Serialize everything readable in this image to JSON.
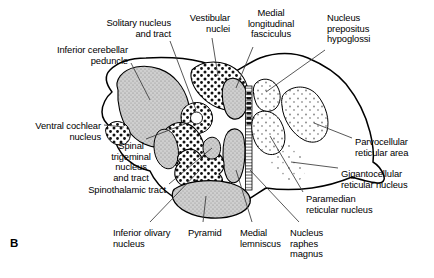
{
  "figure": {
    "panel_letter": "B"
  },
  "labels": [
    {
      "id": "solitary-nucleus-and-tract",
      "lines": [
        "Solitary nucleus",
        "and tract"
      ],
      "align": "right",
      "x": 171,
      "y": 18
    },
    {
      "id": "vestibular-nuclei",
      "lines": [
        "Vestibular",
        "nuclei"
      ],
      "align": "right",
      "x": 230,
      "y": 13
    },
    {
      "id": "medial-longitudinal-fasciculus",
      "lines": [
        "Medial",
        "longitudinal",
        "fasciculus"
      ],
      "align": "center",
      "x": 271,
      "y": 8
    },
    {
      "id": "nucleus-prepositus-hypoglossi",
      "lines": [
        "Nucleus",
        "prepositus",
        "hypoglossi"
      ],
      "align": "left",
      "x": 327,
      "y": 13
    },
    {
      "id": "inferior-cerebellar-peduncle",
      "lines": [
        "Inferior cerebellar",
        "peduncle"
      ],
      "align": "right",
      "x": 128,
      "y": 45
    },
    {
      "id": "ventral-cochlear-nucleus",
      "lines": [
        "Ventral cochlear",
        "nucleus"
      ],
      "align": "right",
      "x": 101,
      "y": 121
    },
    {
      "id": "spinal-trigeminal-nucleus-and-tract",
      "lines": [
        "Spinal",
        "trigeminal",
        "nucleus",
        "and tract"
      ],
      "align": "center",
      "x": 131,
      "y": 141
    },
    {
      "id": "spinothalamic-tract",
      "lines": [
        "Spinothalamic tract"
      ],
      "align": "right",
      "x": 166,
      "y": 185
    },
    {
      "id": "inferior-olivary-nucleus",
      "lines": [
        "Inferior olivary",
        "nucleus"
      ],
      "align": "left",
      "x": 113,
      "y": 228
    },
    {
      "id": "pyramid",
      "lines": [
        "Pyramid"
      ],
      "align": "left",
      "x": 188,
      "y": 228
    },
    {
      "id": "medial-lemniscus",
      "lines": [
        "Medial",
        "lemniscus"
      ],
      "align": "left",
      "x": 240,
      "y": 228
    },
    {
      "id": "nucleus-raphes-magnus",
      "lines": [
        "Nucleus",
        "raphes",
        "magnus"
      ],
      "align": "left",
      "x": 290,
      "y": 228
    },
    {
      "id": "parvocellular-reticular-area",
      "lines": [
        "Parvocellular",
        "reticular area"
      ],
      "align": "left",
      "x": 355,
      "y": 137
    },
    {
      "id": "gigantocellular-reticular-nucleus",
      "lines": [
        "Gigantocellular",
        "reticular nucleus"
      ],
      "align": "left",
      "x": 341,
      "y": 169
    },
    {
      "id": "paramedian-reticular-nucleus",
      "lines": [
        "Paramedian",
        "reticular nucleus"
      ],
      "align": "left",
      "x": 306,
      "y": 194
    }
  ],
  "structures": [
    {
      "id": "inferior-cerebellar-peduncle-region",
      "fill": "stipple-gray"
    },
    {
      "id": "vestibular-nuclei-region",
      "fill": "coarse-dots"
    },
    {
      "id": "solitary-nucleus-region",
      "fill": "dots-ring"
    },
    {
      "id": "spinal-trigeminal-nucleus-region",
      "fill": "coarse-dots"
    },
    {
      "id": "ventral-cochlear-nucleus-region",
      "fill": "coarse-dots"
    },
    {
      "id": "medial-longitudinal-fasciculus-region",
      "fill": "stipple-gray"
    },
    {
      "id": "nucleus-prepositus-hypoglossi-region",
      "fill": "fine-dots"
    },
    {
      "id": "parvocellular-reticular-area-region",
      "fill": "fine-dots"
    },
    {
      "id": "gigantocellular-reticular-nucleus-region",
      "fill": "fine-dots"
    },
    {
      "id": "paramedian-reticular-nucleus-region",
      "fill": "fine-dots"
    },
    {
      "id": "inferior-olivary-nucleus-region",
      "fill": "cells-outline"
    },
    {
      "id": "pyramid-region",
      "fill": "stipple-gray"
    },
    {
      "id": "medial-lemniscus-region",
      "fill": "stipple-gray"
    },
    {
      "id": "nucleus-raphes-magnus-region",
      "fill": "hatched-midline"
    }
  ],
  "colors": {
    "outline": "#000000",
    "text": "#000000",
    "gray_fill": "#c9c9c9",
    "background": "#ffffff"
  }
}
